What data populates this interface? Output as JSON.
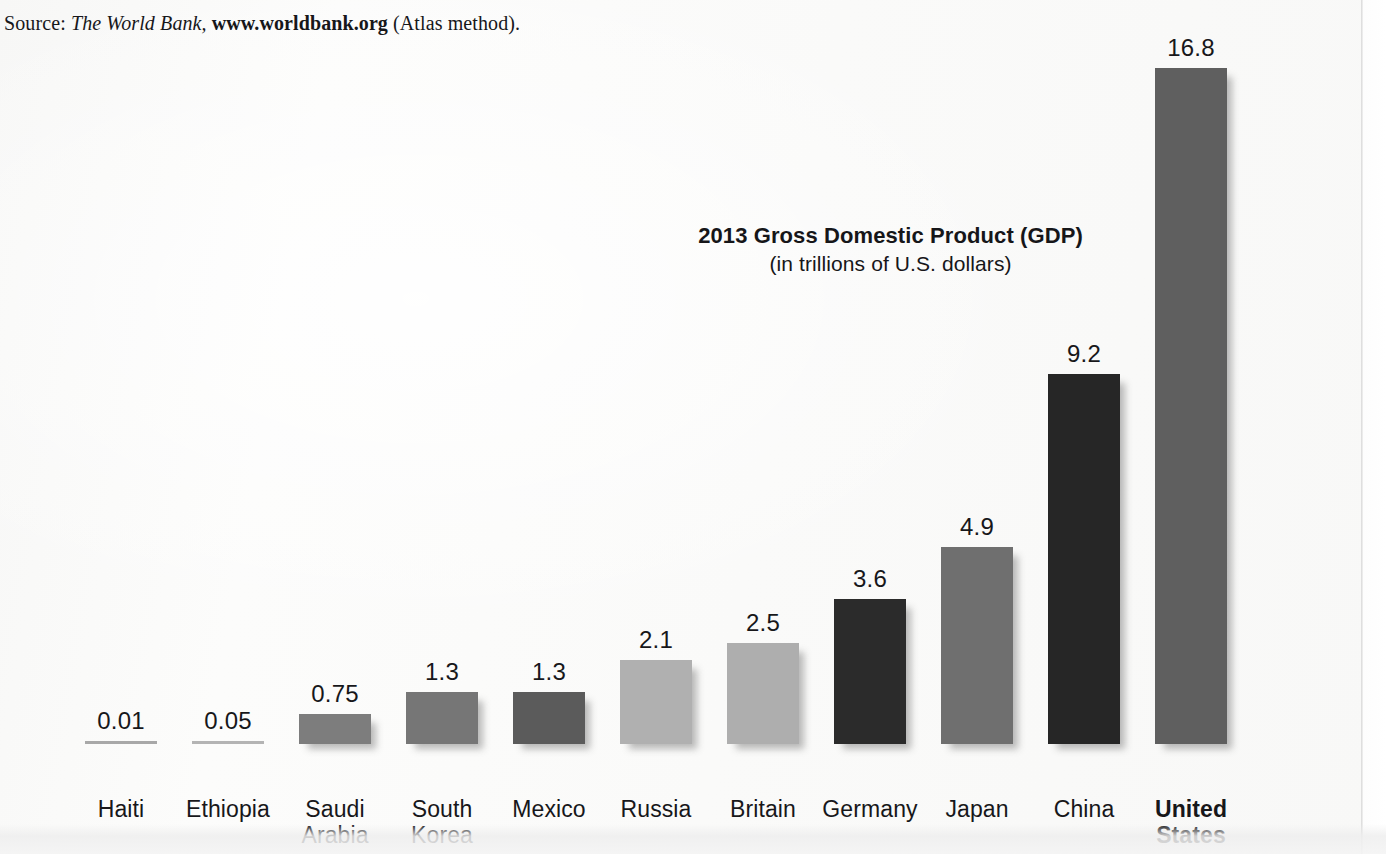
{
  "source": {
    "prefix": "Source: ",
    "publication": "The World Bank,",
    "url": "www.worldbank.org",
    "suffix": " (Atlas method)."
  },
  "chart_data": {
    "type": "bar",
    "title": "2013 Gross Domestic Product (GDP)",
    "subtitle": "(in trillions of U.S. dollars)",
    "xlabel": "",
    "ylabel": "",
    "ylim": [
      0,
      16.8
    ],
    "grid": false,
    "legend": false,
    "value_unit": "trillions of U.S. dollars",
    "categories": [
      "Haiti",
      "Ethiopia",
      "Saudi Arabia",
      "South Korea",
      "Mexico",
      "Russia",
      "Britain",
      "Germany",
      "Japan",
      "China",
      "United States"
    ],
    "values": [
      0.01,
      0.05,
      0.75,
      1.3,
      1.3,
      2.1,
      2.5,
      3.6,
      4.9,
      9.2,
      16.8
    ],
    "value_labels": [
      "0.01",
      "0.05",
      "0.75",
      "1.3",
      "1.3",
      "2.1",
      "2.5",
      "3.6",
      "4.9",
      "9.2",
      "16.8"
    ],
    "bars": [
      {
        "label_line1": "Haiti",
        "label_line2": "",
        "value_label": "0.01",
        "value": 0.01,
        "color": "#a8a8a8",
        "bold_label": false
      },
      {
        "label_line1": "Ethiopia",
        "label_line2": "",
        "value_label": "0.05",
        "value": 0.05,
        "color": "#b4b4b4",
        "bold_label": false
      },
      {
        "label_line1": "Saudi",
        "label_line2": "Arabia",
        "value_label": "0.75",
        "value": 0.75,
        "color": "#7d7d7d",
        "bold_label": false
      },
      {
        "label_line1": "South",
        "label_line2": "Korea",
        "value_label": "1.3",
        "value": 1.3,
        "color": "#767676",
        "bold_label": false
      },
      {
        "label_line1": "Mexico",
        "label_line2": "",
        "value_label": "1.3",
        "value": 1.3,
        "color": "#5b5b5b",
        "bold_label": false
      },
      {
        "label_line1": "Russia",
        "label_line2": "",
        "value_label": "2.1",
        "value": 2.1,
        "color": "#b0b0b0",
        "bold_label": false
      },
      {
        "label_line1": "Britain",
        "label_line2": "",
        "value_label": "2.5",
        "value": 2.5,
        "color": "#aeaeae",
        "bold_label": false
      },
      {
        "label_line1": "Germany",
        "label_line2": "",
        "value_label": "3.6",
        "value": 3.6,
        "color": "#2b2b2b",
        "bold_label": false
      },
      {
        "label_line1": "Japan",
        "label_line2": "",
        "value_label": "4.9",
        "value": 4.9,
        "color": "#6f6f6f",
        "bold_label": false
      },
      {
        "label_line1": "China",
        "label_line2": "",
        "value_label": "9.2",
        "value": 9.2,
        "color": "#262626",
        "bold_label": false
      },
      {
        "label_line1": "United",
        "label_line2": "States",
        "value_label": "16.8",
        "value": 16.8,
        "color": "#5f5f5f",
        "bold_label": true
      }
    ]
  }
}
